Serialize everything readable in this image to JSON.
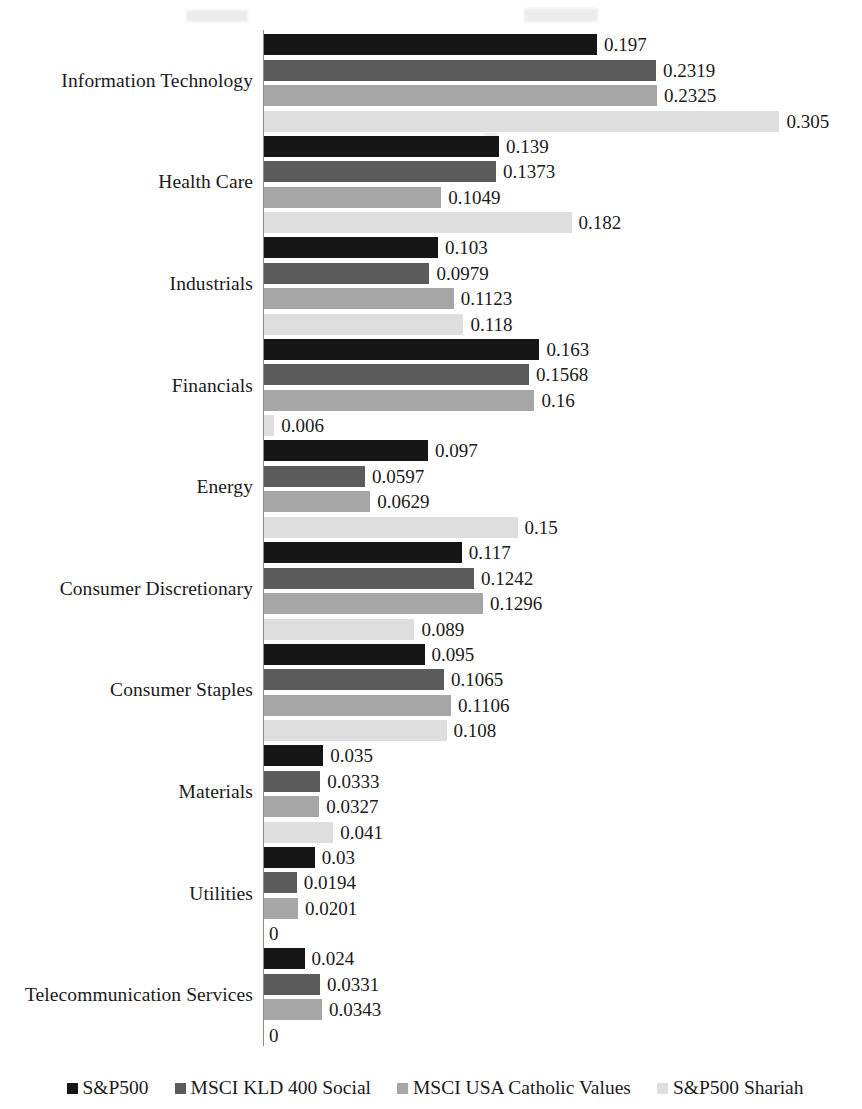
{
  "chart_data": {
    "type": "bar",
    "orientation": "horizontal",
    "title": "",
    "xlabel": "",
    "ylabel": "",
    "grid": false,
    "xlim": [
      0,
      0.305
    ],
    "legend_position": "bottom",
    "value_labels": true,
    "categories": [
      "Information Technology",
      "Health Care",
      "Industrials",
      "Financials",
      "Energy",
      "Consumer Discretionary",
      "Consumer Staples",
      "Materials",
      "Utilities",
      "Telecommunication Services"
    ],
    "series": [
      {
        "name": "S&P500",
        "color": "#161616",
        "values": [
          0.197,
          0.139,
          0.103,
          0.163,
          0.097,
          0.117,
          0.095,
          0.035,
          0.03,
          0.024
        ],
        "labels": [
          "0.197",
          "0.139",
          "0.103",
          "0.163",
          "0.097",
          "0.117",
          "0.095",
          "0.035",
          "0.03",
          "0.024"
        ]
      },
      {
        "name": "MSCI KLD 400 Social",
        "color": "#5b5b5b",
        "values": [
          0.2319,
          0.1373,
          0.0979,
          0.1568,
          0.0597,
          0.1242,
          0.1065,
          0.0333,
          0.0194,
          0.0331
        ],
        "labels": [
          "0.2319",
          "0.1373",
          "0.0979",
          "0.1568",
          "0.0597",
          "0.1242",
          "0.1065",
          "0.0333",
          "0.0194",
          "0.0331"
        ]
      },
      {
        "name": "MSCI USA Catholic Values",
        "color": "#a6a6a6",
        "values": [
          0.2325,
          0.1049,
          0.1123,
          0.16,
          0.0629,
          0.1296,
          0.1106,
          0.0327,
          0.0201,
          0.0343
        ],
        "labels": [
          "0.2325",
          "0.1049",
          "0.1123",
          "0.16",
          "0.0629",
          "0.1296",
          "0.1106",
          "0.0327",
          "0.0201",
          "0.0343"
        ]
      },
      {
        "name": "S&P500 Shariah",
        "color": "#dedede",
        "values": [
          0.305,
          0.182,
          0.118,
          0.006,
          0.15,
          0.089,
          0.108,
          0.041,
          0,
          0
        ],
        "labels": [
          "0.305",
          "0.182",
          "0.118",
          "0.006",
          "0.15",
          "0.089",
          "0.108",
          "0.041",
          "0",
          "0"
        ]
      }
    ]
  },
  "legend": {
    "items": [
      {
        "label": "S&P500",
        "color": "#161616"
      },
      {
        "label": "MSCI KLD 400 Social",
        "color": "#5b5b5b"
      },
      {
        "label": "MSCI USA Catholic Values",
        "color": "#a6a6a6"
      },
      {
        "label": "S&P500 Shariah",
        "color": "#dedede"
      }
    ]
  },
  "layout": {
    "axis_color": "#8a8a8a",
    "pixels_per_unit": 1690,
    "bar_origin_x": 264
  }
}
